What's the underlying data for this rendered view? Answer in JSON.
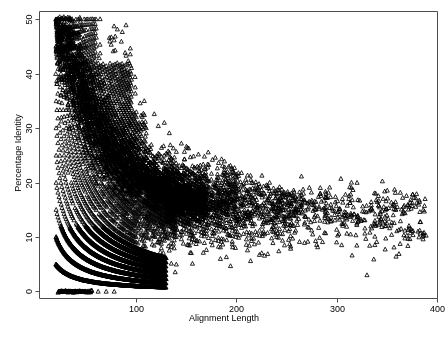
{
  "chart_data": {
    "type": "scatter",
    "title": "",
    "xlabel": "Alignment Length",
    "ylabel": "Percentage Identity",
    "xlim": [
      3,
      400
    ],
    "ylim": [
      -1.2,
      51.5
    ],
    "xticks": [
      100,
      200,
      300,
      400
    ],
    "yticks": [
      0,
      10,
      20,
      30,
      40,
      50
    ],
    "grid": false,
    "legend": null,
    "marker": "triangle-up-open",
    "marker_color": "#000000",
    "marker_size_px": 4,
    "frame": true,
    "n_points_approx": 9000,
    "series": [
      {
        "name": "alignments",
        "x_range": [
          20,
          390
        ],
        "y_range": [
          0,
          50
        ],
        "points_note": "generated from integer-match hyperbolas; see generator parameters",
        "generator": {
          "mode": "hyperbolic-arcs",
          "match_counts": [
            0,
            1,
            2,
            3,
            4,
            5,
            6,
            7,
            8,
            9,
            10,
            11,
            12,
            13,
            14,
            15,
            16,
            17,
            18,
            19,
            20,
            21,
            22,
            23,
            24,
            25,
            26,
            27,
            28,
            29,
            30,
            31,
            32,
            33,
            34,
            35,
            36,
            37,
            38,
            39,
            40,
            41,
            42,
            43,
            44,
            45
          ],
          "length_min": 20,
          "length_max": 395,
          "identity_max": 50.5,
          "density_core_len": [
            20,
            130
          ],
          "tail_len": [
            130,
            390
          ],
          "tail_identity_mean": 16.0,
          "tail_identity_sd": 3.0,
          "zero_band_len": [
            22,
            56
          ]
        }
      }
    ]
  },
  "axes": {
    "x_tick_labels": [
      "100",
      "200",
      "300",
      "400"
    ],
    "y_tick_labels": [
      "0",
      "10",
      "20",
      "30",
      "40",
      "50"
    ],
    "x_axis_title": "Alignment Length",
    "y_axis_title": "Percentage Identity"
  }
}
